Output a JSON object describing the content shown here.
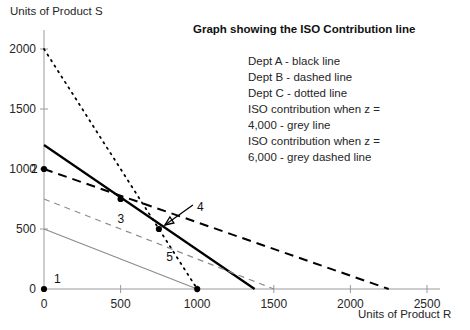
{
  "chart_data": {
    "type": "line",
    "title": "Graph showing the ISO Contribution line",
    "xlabel": "Units of Product R",
    "ylabel": "Units of Product S",
    "xlim": [
      0,
      2600
    ],
    "ylim": [
      0,
      2150
    ],
    "xticks": [
      0,
      500,
      1000,
      1500,
      2000,
      2500
    ],
    "xtick_labels": [
      "0",
      "500",
      "1000",
      "1500",
      "2000",
      "2500"
    ],
    "yticks": [
      0,
      500,
      1000,
      1500,
      2000
    ],
    "ytick_labels": [
      "0",
      "500",
      "1000",
      "1500",
      "2000"
    ],
    "grid": false,
    "legend_position": "top-right",
    "series": [
      {
        "name": "Dept A - black line",
        "style": "solid",
        "color": "#000000",
        "width": 2.2,
        "points": [
          [
            0,
            1200
          ],
          [
            1375,
            0
          ]
        ]
      },
      {
        "name": "Dept B - dashed line",
        "style": "dashed",
        "color": "#000000",
        "width": 2.0,
        "points": [
          [
            0,
            1000
          ],
          [
            2250,
            0
          ]
        ]
      },
      {
        "name": "Dept C - dotted line",
        "style": "dotted",
        "color": "#000000",
        "width": 1.8,
        "points": [
          [
            0,
            2000
          ],
          [
            1000,
            0
          ]
        ]
      },
      {
        "name": "ISO contribution when z = 4,000 - grey line",
        "style": "solid",
        "color": "#8c8c8c",
        "width": 1.2,
        "points": [
          [
            0,
            500
          ],
          [
            1000,
            0
          ]
        ]
      },
      {
        "name": "ISO contribution when z = 6,000 - grey dashed line",
        "style": "dashed",
        "color": "#8c8c8c",
        "width": 1.2,
        "points": [
          [
            0,
            750
          ],
          [
            1500,
            0
          ]
        ]
      }
    ],
    "annotated_points": [
      {
        "label": "1",
        "x": 0,
        "y": 0,
        "label_dx": 10,
        "label_dy": -16,
        "marker": true
      },
      {
        "label": "2",
        "x": 0,
        "y": 1000,
        "label_dx": -13,
        "label_dy": -6,
        "marker": true
      },
      {
        "label": "3",
        "x": 500,
        "y": 750,
        "label_dx": -3,
        "label_dy": 14,
        "marker": true
      },
      {
        "label": "4",
        "x": 750,
        "y": 500,
        "label_dx": 38,
        "label_dy": -28,
        "marker": true,
        "arrow": true
      },
      {
        "label": "5",
        "x": 1000,
        "y": 0,
        "label_dx": -31,
        "label_dy": -38,
        "marker": true
      }
    ]
  },
  "legend": {
    "entries": [
      "Dept A - black line",
      "Dept B - dashed line",
      "Dept C - dotted line",
      "ISO contribution when z =",
      "4,000 - grey line",
      "ISO contribution when z =",
      "6,000 - grey dashed line"
    ]
  }
}
